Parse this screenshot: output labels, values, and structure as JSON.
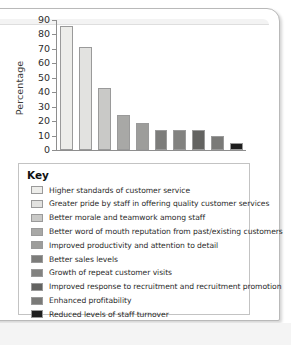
{
  "chart_data": {
    "type": "bar",
    "title": "",
    "xlabel": "",
    "ylabel": "Percentage",
    "ylim": [
      0,
      90
    ],
    "yticks": [
      90,
      80,
      70,
      60,
      50,
      40,
      30,
      20,
      10,
      0
    ],
    "grid": false,
    "legend_position": "below-chart",
    "legend_title": "Key",
    "categories": [
      "Higher standards of customer service",
      "Greater pride by staff in offering quality customer services",
      "Better morale and teamwork among staff",
      "Better word of mouth reputation from past/existing customers",
      "Improved productivity and attention to detail",
      "Better sales levels",
      "Growth of repeat customer visits",
      "Improved response to recruitment and recruitment promotion",
      "Enhanced profitability",
      "Reduced levels of staff turnover"
    ],
    "values": [
      86,
      71,
      43,
      24,
      19,
      14,
      14,
      14,
      10,
      5
    ],
    "colors": [
      "#ededea",
      "#e2e2e0",
      "#c9c9c7",
      "#a8a8a6",
      "#9d9d9b",
      "#7c7c7a",
      "#828280",
      "#636361",
      "#7a7a78",
      "#1e1e1e"
    ]
  },
  "chart": {
    "ylabel": "Percentage",
    "yticks": [
      "90",
      "80",
      "70",
      "60",
      "50",
      "40",
      "30",
      "20",
      "10",
      "0"
    ]
  },
  "key": {
    "title": "Key",
    "items": [
      {
        "label": "Higher standards of customer service",
        "color": "#ededea"
      },
      {
        "label": "Greater pride by staff in offering quality customer services",
        "color": "#e2e2e0"
      },
      {
        "label": "Better morale and teamwork among staff",
        "color": "#c9c9c7"
      },
      {
        "label": "Better word of mouth reputation from past/existing customers",
        "color": "#a8a8a6"
      },
      {
        "label": "Improved productivity and attention to detail",
        "color": "#9d9d9b"
      },
      {
        "label": "Better sales levels",
        "color": "#7c7c7a"
      },
      {
        "label": "Growth of repeat customer visits",
        "color": "#828280"
      },
      {
        "label": "Improved response to recruitment and recruitment promotion",
        "color": "#636361"
      },
      {
        "label": "Enhanced profitability",
        "color": "#7a7a78"
      },
      {
        "label": "Reduced levels of staff turnover",
        "color": "#1e1e1e"
      }
    ]
  }
}
